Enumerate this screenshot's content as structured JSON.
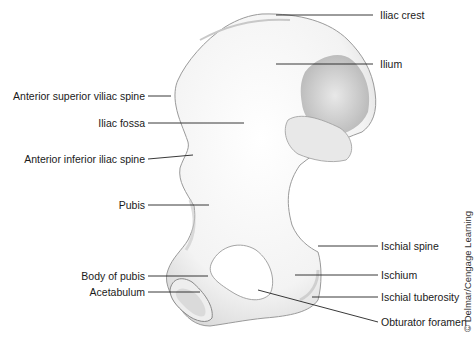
{
  "figure": {
    "labels_right": [
      {
        "id": "iliac-crest",
        "text": "Iliac crest"
      },
      {
        "id": "ilium",
        "text": "Ilium"
      },
      {
        "id": "ischial-spine",
        "text": "Ischial spine"
      },
      {
        "id": "ischium",
        "text": "Ischium"
      },
      {
        "id": "ischial-tuberosity",
        "text": "Ischial tuberosity"
      },
      {
        "id": "obturator-foramen",
        "text": "Obturator foramen"
      }
    ],
    "labels_left": [
      {
        "id": "anterior-superior-iliac-spine",
        "text": "Anterior superior viliac spine"
      },
      {
        "id": "iliac-fossa",
        "text": "Iliac fossa"
      },
      {
        "id": "anterior-inferior-iliac-spine",
        "text": "Anterior inferior iliac spine"
      },
      {
        "id": "pubis",
        "text": "Pubis"
      },
      {
        "id": "body-of-pubis",
        "text": "Body of pubis"
      },
      {
        "id": "acetabulum",
        "text": "Acetabulum"
      }
    ],
    "credit": "© Delmar/Cengage Learning"
  }
}
